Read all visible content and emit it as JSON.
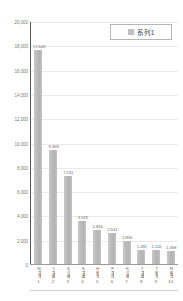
{
  "chart_data": {
    "type": "bar",
    "title": "",
    "xlabel": "",
    "ylabel": "",
    "ylim": [
      0,
      20000
    ],
    "ytick_step": 2000,
    "grid": true,
    "legend_position": "top-right",
    "legend_entries": [
      "系列1"
    ],
    "series": [
      {
        "name": "系列1",
        "values": [
          17609,
          9368,
          7231,
          3525,
          2816,
          2541,
          1856,
          1181,
          1116,
          1058
        ]
      }
    ],
    "categories": [
      "N運送",
      "Y運輸",
      "S急便",
      "S運輸",
      "H物流",
      "F運送",
      "K急便",
      "T運輸",
      "T物流",
      "N輸送"
    ],
    "category_numbers": [
      "1",
      "2",
      "3",
      "4",
      "5",
      "6",
      "7",
      "8",
      "9",
      "10"
    ],
    "value_labels": [
      "17,609",
      "9,368",
      "7,231",
      "3,525",
      "2,816",
      "2,541",
      "1,856",
      "1,181",
      "1,116",
      "1,058"
    ],
    "ytick_labels": [
      "20,000",
      "18,000",
      "16,000",
      "14,000",
      "12,000",
      "10,000",
      "8,000",
      "6,000",
      "4,000",
      "2,000",
      "0"
    ],
    "ytick_values": [
      20000,
      18000,
      16000,
      14000,
      12000,
      10000,
      8000,
      6000,
      4000,
      2000,
      0
    ],
    "colors": {
      "bar": "#bfbfbf",
      "grid": "#eaeaea",
      "axis": "#5a5a5a",
      "text": "#6f6f6f",
      "background": "#ffffff"
    }
  }
}
